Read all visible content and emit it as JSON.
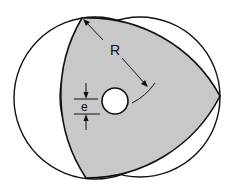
{
  "diagram": {
    "labels": {
      "radius": "R",
      "eccentricity": "e"
    },
    "colors": {
      "rotor_fill": "#c8c8c8",
      "stroke": "#111111",
      "background": "#ffffff"
    },
    "shapes": {
      "left_circle": {
        "cx": 95,
        "cy": 98,
        "r": 81
      },
      "right_circle": {
        "cx": 140,
        "cy": 97,
        "r": 80
      },
      "rotor_vertices": [
        [
          82,
          18
        ],
        [
          86,
          178
        ],
        [
          220,
          96
        ]
      ],
      "shaft_hole": {
        "cx": 115,
        "cy": 101,
        "r": 13
      }
    }
  }
}
